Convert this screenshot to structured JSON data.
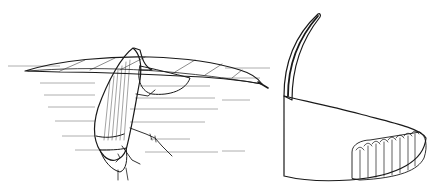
{
  "image": {
    "width": 438,
    "height": 192,
    "background": "#ffffff",
    "ink_color": "#1a1a1a",
    "style": "pen-and-ink scientific illustration",
    "panels": [
      {
        "id": "left",
        "subject": "water beetle beneath floating leaf with egg cocoon attached",
        "elements": [
          "water-surface-lines",
          "floating-leaf",
          "beetle-body",
          "egg-cocoon",
          "beetle-legs"
        ]
      },
      {
        "id": "right",
        "subject": "detail of egg cocoon with mast and exposed eggs",
        "elements": [
          "cocoon-mast",
          "cocoon-body",
          "cocoon-texture",
          "egg-row"
        ]
      }
    ]
  }
}
